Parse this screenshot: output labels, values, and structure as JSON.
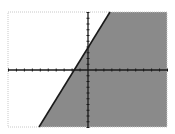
{
  "chart_data": {
    "type": "area",
    "title": "",
    "xlabel": "",
    "ylabel": "",
    "xlim": [
      -10,
      10
    ],
    "ylim": [
      -10,
      10
    ],
    "xscl": 1,
    "yscl": 1,
    "grid": false,
    "legend": null,
    "inequality": "y <= 2.23x + 3.8",
    "boundary_line": {
      "slope": 2.23,
      "y_intercept": 3.8,
      "x_intercept": -1.7,
      "style": "solid",
      "points": [
        {
          "x": -6.2,
          "y": -10
        },
        {
          "x": 2.8,
          "y": 10
        }
      ]
    },
    "shaded_region": "below-right of line",
    "colors": {
      "shade": "#8a8a8a",
      "line": "#1a1a1a",
      "axes": "#1a1a1a",
      "border": "#c8c8c8",
      "background": "#ffffff"
    }
  },
  "plot": {
    "left": 8,
    "top": 12,
    "right": 167,
    "bottom": 127,
    "origin_px": {
      "x": 88,
      "y": 70
    },
    "line_top_px": {
      "x": 110,
      "y": 12
    },
    "line_bottom_px": {
      "x": 39,
      "y": 127
    }
  }
}
